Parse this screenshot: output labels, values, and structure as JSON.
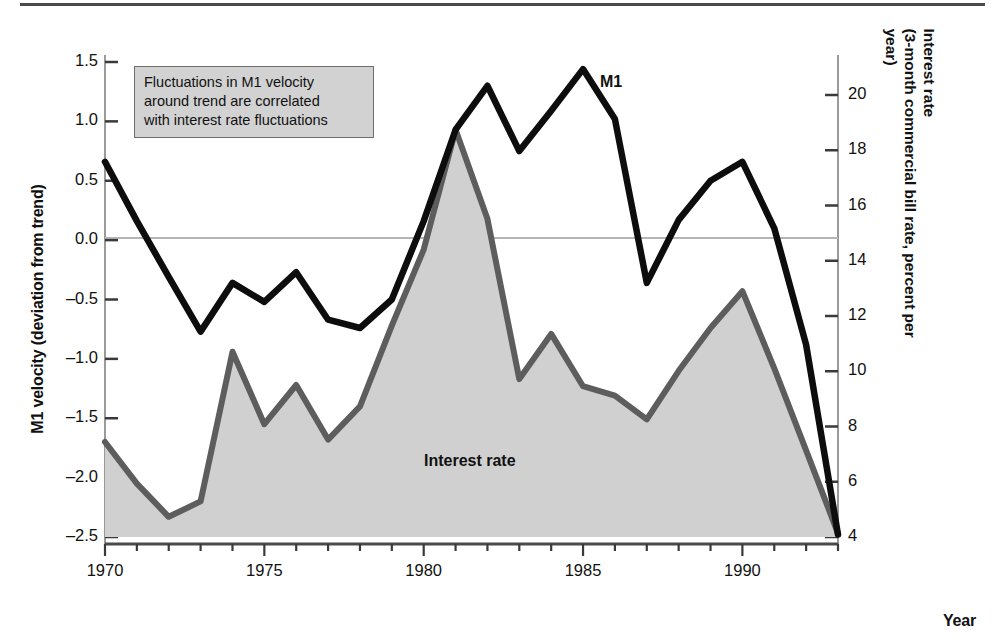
{
  "axes": {
    "left_title": "M1 velocity (deviation from trend)",
    "right_title": "Interest rate\n(3-month commercial bill rate, percent per year)",
    "x_title": "Year",
    "left_ticks": [
      "1.5",
      "1.0",
      "0.5",
      "0.0",
      "-0.5",
      "-1.0",
      "-1.5",
      "-2.0",
      "-2.5"
    ],
    "right_ticks": [
      "20",
      "18",
      "16",
      "14",
      "12",
      "10",
      "8",
      "6",
      "4"
    ],
    "x_ticks": [
      "1970",
      "1975",
      "1980",
      "1985",
      "1990"
    ]
  },
  "annotation": {
    "text": "Fluctuations in M1 velocity\naround trend are correlated\nwith interest rate fluctuations"
  },
  "labels": {
    "m1": "M1",
    "interest_rate": "Interest rate"
  },
  "colors": {
    "m1_line": "#0d0d0d",
    "interest_line": "#5d5d5d",
    "interest_fill": "#d0d0d0",
    "axis": "#9a9a9a",
    "zero_line": "#b5b5b5",
    "annotation_bg": "#d2d2d2",
    "annotation_border": "#6e6e6e",
    "rule": "#4a4a4a"
  },
  "chart_data": {
    "type": "line",
    "title": "",
    "xlabel": "Year",
    "ylabel": "M1 velocity (deviation from trend)",
    "y2label": "Interest rate (3-month commercial bill rate, percent per year)",
    "xlim": [
      1970,
      1993
    ],
    "ylim": [
      -2.5,
      1.5
    ],
    "y2lim": [
      4,
      20.7
    ],
    "grid": false,
    "zero_reference_line": 0.0,
    "legend": "inline-labels",
    "x": [
      1970,
      1971,
      1972,
      1973,
      1974,
      1975,
      1976,
      1977,
      1978,
      1979,
      1980,
      1981,
      1982,
      1983,
      1984,
      1985,
      1986,
      1987,
      1988,
      1989,
      1990,
      1991,
      1992,
      1993
    ],
    "series": [
      {
        "name": "M1",
        "axis": "left",
        "units": "deviation from trend",
        "values": [
          0.66,
          0.16,
          -0.31,
          -0.77,
          -0.36,
          -0.52,
          -0.27,
          -0.67,
          -0.74,
          -0.5,
          0.16,
          0.93,
          1.3,
          0.75,
          1.09,
          1.44,
          1.02,
          -0.36,
          0.17,
          0.5,
          0.66,
          0.1,
          -0.88,
          -2.48
        ]
      },
      {
        "name": "Interest rate",
        "axis": "right",
        "units": "percent per year",
        "values_left_scale": [
          -1.7,
          -2.05,
          -2.33,
          -2.2,
          -0.94,
          -1.55,
          -1.22,
          -1.68,
          -1.4,
          -0.72,
          -0.08,
          0.93,
          0.18,
          -1.17,
          -0.79,
          -1.23,
          -1.31,
          -1.51,
          -1.1,
          -0.74,
          -0.43,
          -1.08,
          -1.77,
          -2.47
        ],
        "values": [
          7.7,
          6.3,
          5.4,
          5.9,
          10.9,
          8.4,
          9.6,
          7.8,
          8.7,
          11.2,
          13.3,
          17.5,
          14.5,
          9.8,
          11.3,
          9.5,
          9.2,
          8.5,
          10.0,
          12.0,
          12.9,
          10.1,
          7.4,
          4.4
        ]
      }
    ]
  }
}
